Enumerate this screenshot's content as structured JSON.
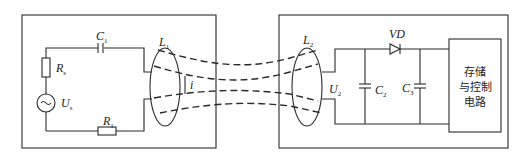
{
  "diagram": {
    "type": "wireless-power-transfer-circuit",
    "transmitter": {
      "components": [
        {
          "id": "Rs",
          "label": "R",
          "sub": "s",
          "kind": "resistor"
        },
        {
          "id": "Us",
          "label": "U",
          "sub": "s",
          "kind": "ac-source"
        },
        {
          "id": "C1",
          "label": "C",
          "sub": "1",
          "kind": "capacitor"
        },
        {
          "id": "R1",
          "label": "R",
          "sub": "1",
          "kind": "resistor"
        },
        {
          "id": "L1",
          "label": "L",
          "sub": "1",
          "kind": "coil"
        }
      ],
      "current_label": "i"
    },
    "receiver": {
      "components": [
        {
          "id": "L2",
          "label": "L",
          "sub": "2",
          "kind": "coil"
        },
        {
          "id": "U2",
          "label": "U",
          "sub": "2",
          "kind": "voltage"
        },
        {
          "id": "C2",
          "label": "C",
          "sub": "2",
          "kind": "capacitor"
        },
        {
          "id": "VD",
          "label": "VD",
          "kind": "diode"
        },
        {
          "id": "C3",
          "label": "C",
          "sub": "3",
          "kind": "capacitor"
        }
      ],
      "block": {
        "lines": [
          "存储",
          "与控制",
          "电路"
        ]
      }
    },
    "flux_lines": 4
  }
}
